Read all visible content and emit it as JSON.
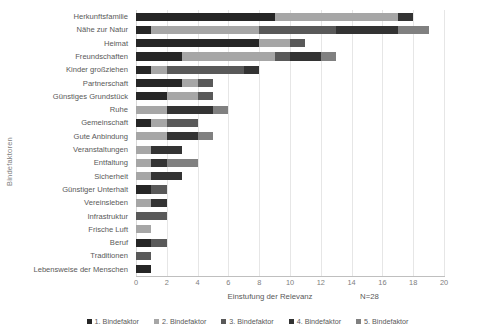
{
  "chart_data": {
    "type": "bar",
    "orientation": "horizontal",
    "stacked": true,
    "title": "",
    "xlabel": "Einstufung der Relevanz",
    "ylabel": "Bindefaktoren",
    "annotation": "N=28",
    "xlim": [
      0,
      20
    ],
    "xticks": [
      0,
      2,
      4,
      6,
      8,
      10,
      12,
      14,
      16,
      18,
      20
    ],
    "grid": "vertical",
    "legend_position": "bottom",
    "categories": [
      "Herkunftsfamilie",
      "Nähe zur Natur",
      "Heimat",
      "Freundschaften",
      "Kinder großziehen",
      "Partnerschaft",
      "Günstiges Grundstück",
      "Ruhe",
      "Gemeinschaft",
      "Gute Anbindung",
      "Veranstaltungen",
      "Entfaltung",
      "Sicherheit",
      "Günstiger Unterhalt",
      "Vereinsleben",
      "Infrastruktur",
      "Frische Luft",
      "Beruf",
      "Traditionen",
      "Lebensweise der Menschen"
    ],
    "series": [
      {
        "name": "1. Bindefaktor",
        "color": "#262626",
        "values": [
          9,
          1,
          8,
          3,
          1,
          3,
          2,
          0,
          1,
          0,
          0,
          0,
          0,
          1,
          0,
          0,
          0,
          1,
          0,
          1
        ]
      },
      {
        "name": "2. Bindefaktor",
        "color": "#a6a6a6",
        "values": [
          8,
          7,
          2,
          6,
          1,
          1,
          2,
          2,
          1,
          2,
          1,
          1,
          1,
          0,
          1,
          0,
          1,
          0,
          0,
          0
        ]
      },
      {
        "name": "3. Bindefaktor",
        "color": "#595959",
        "values": [
          0,
          5,
          1,
          1,
          5,
          1,
          1,
          0,
          2,
          0,
          0,
          0,
          0,
          1,
          0,
          2,
          0,
          1,
          1,
          0
        ]
      },
      {
        "name": "4. Bindefaktor",
        "color": "#333333",
        "values": [
          1,
          4,
          0,
          2,
          1,
          0,
          0,
          3,
          0,
          2,
          2,
          1,
          2,
          0,
          1,
          0,
          0,
          0,
          0,
          0
        ]
      },
      {
        "name": "5. Bindefaktor",
        "color": "#808080",
        "values": [
          0,
          2,
          0,
          1,
          0,
          0,
          0,
          1,
          0,
          1,
          0,
          2,
          0,
          0,
          0,
          0,
          0,
          0,
          0,
          0
        ]
      }
    ],
    "totals": [
      18,
      19,
      11,
      13,
      8,
      5,
      5,
      6,
      4,
      5,
      3,
      4,
      3,
      2,
      2,
      2,
      1,
      2,
      1,
      1
    ]
  },
  "legend": {
    "items": [
      {
        "label": "1. Bindefaktor",
        "color": "#262626"
      },
      {
        "label": "2. Bindefaktor",
        "color": "#a6a6a6"
      },
      {
        "label": "3. Bindefaktor",
        "color": "#595959"
      },
      {
        "label": "4. Bindefaktor",
        "color": "#333333"
      },
      {
        "label": "5. Bindefaktor",
        "color": "#808080"
      }
    ]
  }
}
